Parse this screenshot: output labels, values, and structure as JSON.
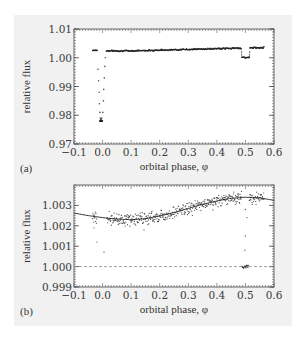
{
  "chart_data": [
    {
      "panel_label": "(a)",
      "type": "scatter",
      "title": "",
      "xlabel": "orbital phase, φ",
      "ylabel": "relative flux",
      "xlim": [
        -0.1,
        0.6
      ],
      "ylim": [
        0.97,
        1.01
      ],
      "xticks": [
        "−0.1",
        "0.0",
        "0.1",
        "0.2",
        "0.3",
        "0.4",
        "0.5",
        "0.6"
      ],
      "yticks": [
        "0.97",
        "0.98",
        "0.99",
        "1.00",
        "1.01"
      ],
      "grid": false,
      "legend": null,
      "series": [
        {
          "name": "photometry",
          "description": "Light curve with primary transit at φ≈0 and secondary eclipse at φ≈0.5",
          "x": [
            -0.035,
            -0.03,
            -0.025,
            -0.02,
            -0.017,
            -0.015,
            -0.013,
            -0.011,
            -0.009,
            -0.007,
            -0.005,
            -0.003,
            0.0,
            0.002,
            0.004,
            0.006,
            0.008,
            0.012,
            0.02,
            0.05,
            0.1,
            0.15,
            0.2,
            0.25,
            0.3,
            0.35,
            0.4,
            0.45,
            0.48,
            0.49,
            0.5,
            0.51,
            0.52,
            0.53,
            0.55,
            0.565
          ],
          "y": [
            1.0025,
            1.0027,
            1.0026,
            1.0022,
            0.997,
            0.993,
            0.989,
            0.984,
            0.979,
            0.9782,
            0.978,
            0.9784,
            0.982,
            0.986,
            0.991,
            0.996,
            1.0,
            1.0028,
            1.003,
            1.0026,
            1.0023,
            1.0024,
            1.0026,
            1.0028,
            1.003,
            1.0031,
            1.0033,
            1.0034,
            1.0034,
            1.0002,
            1.0001,
            1.0001,
            1.0003,
            1.0033,
            1.0034,
            1.0033
          ]
        }
      ]
    },
    {
      "panel_label": "(b)",
      "type": "scatter",
      "title": "",
      "xlabel": "orbital phase, φ",
      "ylabel": "relative flux",
      "xlim": [
        -0.1,
        0.6
      ],
      "ylim": [
        0.999,
        1.004
      ],
      "xticks": [
        "−0.1",
        "0.0",
        "0.1",
        "0.2",
        "0.3",
        "0.4",
        "0.5",
        "0.6"
      ],
      "yticks": [
        "0.999",
        "1.000",
        "1.001",
        "1.002",
        "1.003"
      ],
      "grid": false,
      "legend": null,
      "reference_line": {
        "y": 1.0,
        "style": "dashed"
      },
      "series": [
        {
          "name": "binned photometry (zoom)",
          "type": "scatter",
          "x": [
            -0.03,
            -0.028,
            -0.025,
            -0.02,
            -0.03,
            -0.027,
            0.02,
            0.03,
            0.04,
            0.05,
            0.06,
            0.08,
            0.1,
            0.12,
            0.15,
            0.18,
            0.2,
            0.22,
            0.25,
            0.28,
            0.3,
            0.33,
            0.35,
            0.38,
            0.4,
            0.42,
            0.45,
            0.47,
            0.49,
            0.5,
            0.5,
            0.505,
            0.51,
            0.52,
            0.53,
            0.54,
            0.55
          ],
          "y": [
            1.0029,
            1.0032,
            1.0028,
            1.0025,
            1.0019,
            1.0012,
            1.003,
            1.0032,
            1.0028,
            1.0027,
            1.0025,
            1.0023,
            1.0023,
            1.0024,
            1.0022,
            1.0025,
            1.0027,
            1.0026,
            1.003,
            1.0029,
            1.0031,
            1.0033,
            1.0032,
            1.0036,
            1.0034,
            1.0036,
            1.0033,
            1.0035,
            1.002,
            1.0003,
            1.0,
            0.9999,
            1.0001,
            1.0032,
            1.0034,
            1.0031,
            1.0033
          ]
        },
        {
          "name": "phase-curve model",
          "type": "line",
          "x": [
            -0.1,
            -0.05,
            0.0,
            0.05,
            0.1,
            0.15,
            0.2,
            0.25,
            0.3,
            0.35,
            0.4,
            0.45,
            0.5,
            0.55,
            0.6
          ],
          "y": [
            1.00262,
            1.0025,
            1.0024,
            1.00233,
            1.0023,
            1.00235,
            1.00248,
            1.00265,
            1.00285,
            1.00305,
            1.00322,
            1.00335,
            1.0034,
            1.00337,
            1.00325
          ]
        }
      ]
    }
  ]
}
